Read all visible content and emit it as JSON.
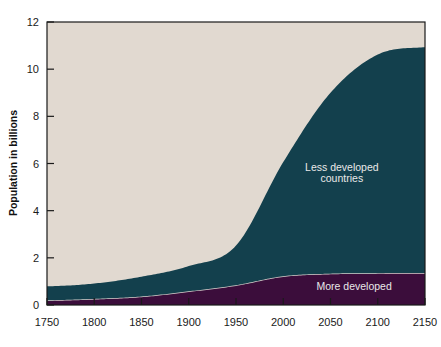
{
  "chart_data": {
    "type": "area",
    "title": "",
    "subtitle": "",
    "xlabel": "",
    "ylabel": "Population in billions",
    "xlim": [
      1750,
      2150
    ],
    "ylim": [
      0,
      12
    ],
    "grid": false,
    "stacked": true,
    "legend_position": "inline-annotation",
    "xticks": [
      1750,
      1800,
      1850,
      1900,
      1950,
      2000,
      2050,
      2100,
      2150
    ],
    "xtick_labels": [
      "1750",
      "1800",
      "1850",
      "1900",
      "1950",
      "2000",
      "2050",
      "2100",
      "2150"
    ],
    "yticks": [
      0,
      2,
      4,
      6,
      8,
      10,
      12
    ],
    "ytick_labels": [
      "0",
      "2",
      "4",
      "6",
      "8",
      "10",
      "12"
    ],
    "x": [
      1750,
      1800,
      1850,
      1900,
      1950,
      2000,
      2050,
      2100,
      2150
    ],
    "series": [
      {
        "name": "More developed",
        "label": "More developed",
        "color": "#3b0d3b",
        "values": [
          0.17,
          0.23,
          0.33,
          0.55,
          0.81,
          1.19,
          1.3,
          1.32,
          1.33
        ]
      },
      {
        "name": "Less developed countries",
        "label": "Less developed countries",
        "color": "#13404d",
        "values": [
          0.62,
          0.68,
          0.87,
          1.1,
          1.71,
          4.87,
          7.7,
          9.3,
          9.6
        ]
      }
    ],
    "annotations": [
      {
        "text": "Less developed",
        "x": 2062,
        "y": 5.7,
        "color": "#e8e8e8"
      },
      {
        "text": "countries",
        "x": 2062,
        "y": 5.22,
        "color": "#e8e8e8"
      },
      {
        "text": "More developed",
        "x": 2075,
        "y": 0.62,
        "color": "#e8e8e8"
      }
    ],
    "colors": {
      "plot_background": "#e1d9d0",
      "less_developed": "#13404d",
      "more_developed": "#3b0d3b",
      "band_separator": "#d8d2ce",
      "axis": "#1a1a1a",
      "page_background": "#ffffff"
    }
  },
  "axis": {
    "y_axis_title": "Population in billions"
  }
}
